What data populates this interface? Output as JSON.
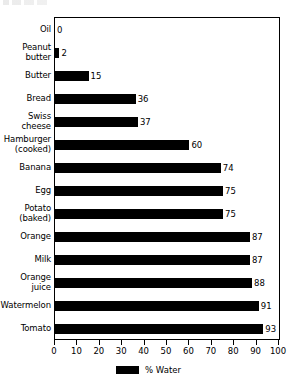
{
  "chart_data": {
    "type": "bar",
    "orientation": "horizontal",
    "title": "",
    "xlabel": "",
    "ylabel": "",
    "xlim": [
      0,
      100
    ],
    "xticks": [
      0,
      10,
      20,
      30,
      40,
      50,
      60,
      70,
      80,
      90,
      100
    ],
    "grid": false,
    "legend": {
      "position": "bottom",
      "entries": [
        {
          "label": "% Water",
          "color": "#000000"
        }
      ]
    },
    "series": [
      {
        "name": "% Water",
        "color": "#000000",
        "values": [
          0,
          2,
          15,
          36,
          37,
          60,
          74,
          75,
          75,
          87,
          87,
          88,
          91,
          93
        ]
      }
    ],
    "categories": [
      "Oil",
      "Peanut\nbutter",
      "Butter",
      "Bread",
      "Swiss\ncheese",
      "Hamburger\n(cooked)",
      "Banana",
      "Egg",
      "Potato\n(baked)",
      "Orange",
      "Milk",
      "Orange\njuice",
      "Watermelon",
      "Tomato"
    ],
    "data_labels": [
      "0",
      "2",
      "15",
      "36",
      "37",
      "60",
      "74",
      "75",
      "75",
      "87",
      "87",
      "88",
      "91",
      "93"
    ],
    "colors": {
      "bar": "#000000",
      "frame": "#000000",
      "background": "#ffffff",
      "text": "#000000"
    }
  }
}
